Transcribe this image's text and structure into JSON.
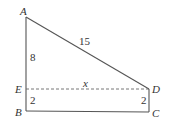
{
  "figure": {
    "points": {
      "A": "A",
      "B": "B",
      "C": "C",
      "D": "D",
      "E": "E"
    },
    "segments": [
      {
        "from": "A",
        "to": "E",
        "style": "solid",
        "label": "8"
      },
      {
        "from": "E",
        "to": "B",
        "style": "solid",
        "label": "2"
      },
      {
        "from": "B",
        "to": "C",
        "style": "solid",
        "label": ""
      },
      {
        "from": "C",
        "to": "D",
        "style": "solid",
        "label": "2"
      },
      {
        "from": "D",
        "to": "A",
        "style": "solid",
        "label": "15"
      },
      {
        "from": "E",
        "to": "D",
        "style": "dashed",
        "label": "x"
      }
    ],
    "labels": {
      "AE": "8",
      "EB": "2",
      "DC": "2",
      "AD": "15",
      "ED": "x"
    }
  }
}
